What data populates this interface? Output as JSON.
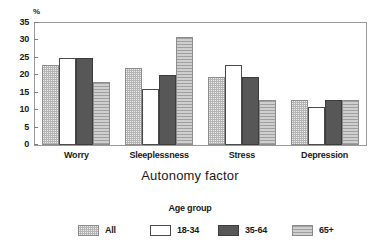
{
  "chart_data": {
    "type": "bar",
    "title": "",
    "xlabel": "Autonomy factor",
    "ylabel": "%",
    "y_unit_label": "%",
    "categories": [
      "Worry",
      "Sleeplessness",
      "Stress",
      "Depression"
    ],
    "series": [
      {
        "name": "All",
        "values": [
          23,
          22,
          19.5,
          13
        ]
      },
      {
        "name": "18-34",
        "values": [
          25,
          16,
          23,
          11
        ]
      },
      {
        "name": "35-64",
        "values": [
          25,
          20,
          19.5,
          13
        ]
      },
      {
        "name": "65+",
        "values": [
          18,
          31,
          13,
          13
        ]
      }
    ],
    "ylim": [
      0,
      35
    ],
    "yticks": [
      0,
      5,
      10,
      15,
      20,
      25,
      30,
      35
    ],
    "ytick_labels": [
      "0",
      "5",
      "10",
      "15",
      "20",
      "25",
      "30",
      "35"
    ],
    "grid": false,
    "legend": {
      "title": "Age group",
      "position": "bottom",
      "entries": [
        {
          "label": "All",
          "swatch": "all",
          "color": "#b4b4b4",
          "pattern": "stipple"
        },
        {
          "label": "18-34",
          "swatch": "young",
          "color": "#ffffff",
          "pattern": "solid"
        },
        {
          "label": "35-64",
          "swatch": "mid",
          "color": "#575757",
          "pattern": "solid"
        },
        {
          "label": "65+",
          "swatch": "old",
          "color": "#cfcfcf",
          "pattern": "horizontal-lines"
        }
      ]
    }
  }
}
